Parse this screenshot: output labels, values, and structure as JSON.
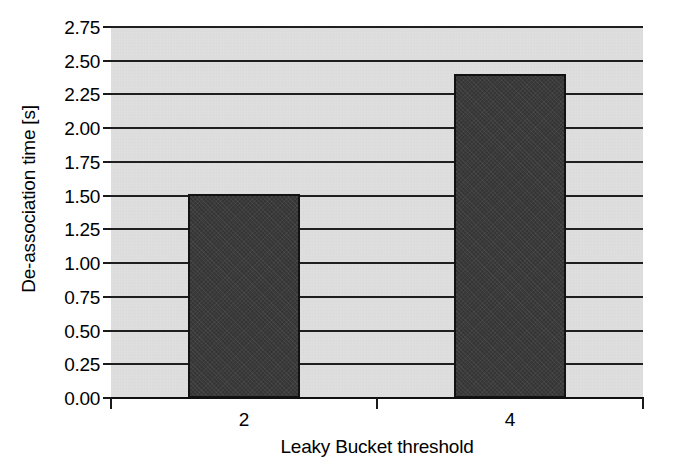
{
  "chart_data": {
    "type": "bar",
    "title": "",
    "xlabel": "Leaky Bucket threshold",
    "ylabel": "De-association time [s]",
    "categories": [
      "2",
      "4"
    ],
    "values": [
      1.51,
      2.4
    ],
    "ylim": [
      0.0,
      2.75
    ],
    "ytick_labels": [
      "0.00",
      "0.25",
      "0.50",
      "0.75",
      "1.00",
      "1.25",
      "1.50",
      "1.75",
      "2.00",
      "2.25",
      "2.50",
      "2.75"
    ],
    "ytick_values": [
      0.0,
      0.25,
      0.5,
      0.75,
      1.0,
      1.25,
      1.5,
      1.75,
      2.0,
      2.25,
      2.5,
      2.75
    ],
    "grid": true,
    "legend": false,
    "legend_position": "none",
    "bar_color": "#3b3b3b",
    "bar_edge_color": "#121212",
    "plot_background": "#e2e2e2",
    "gridline_color": "#1f1f1f",
    "figure_background": "#ffffff"
  }
}
